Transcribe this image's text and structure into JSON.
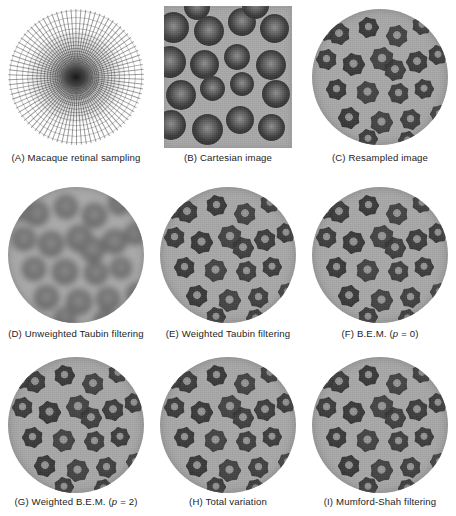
{
  "figure": {
    "panels": [
      {
        "id": "A",
        "letter": "(A)",
        "caption": "Macaque retinal sampling",
        "kind": "mesh",
        "shape": "disc"
      },
      {
        "id": "B",
        "letter": "(B)",
        "caption": "Cartesian image",
        "kind": "smooth",
        "shape": "square"
      },
      {
        "id": "C",
        "letter": "(C)",
        "caption": "Resampled image",
        "kind": "blocky",
        "shape": "disc"
      },
      {
        "id": "D",
        "letter": "(D)",
        "caption": "Unweighted Taubin filtering",
        "kind": "blur",
        "shape": "disc"
      },
      {
        "id": "E",
        "letter": "(E)",
        "caption": "Weighted Taubin filtering",
        "kind": "blocky",
        "shape": "disc"
      },
      {
        "id": "F",
        "letter": "(F)",
        "caption": "B.E.M. (",
        "caption_italic": "p",
        "caption_tail": " = 0)",
        "kind": "blocky",
        "shape": "disc"
      },
      {
        "id": "G",
        "letter": "(G)",
        "caption": "Weighted B.E.M. (",
        "caption_italic": "p",
        "caption_tail": " = 2)",
        "kind": "blocky",
        "shape": "disc"
      },
      {
        "id": "H",
        "letter": "(H)",
        "caption": "Total variation",
        "kind": "blocky",
        "shape": "disc"
      },
      {
        "id": "I",
        "letter": "(I)",
        "caption": "Mumford-Shah filtering",
        "kind": "blocky",
        "shape": "disc"
      }
    ],
    "colors": {
      "background": "#ffffff",
      "plasma_gray": "#a9a9a9",
      "cell_dark": "#343434",
      "caption_text": "#1d1d1d"
    },
    "cells": {
      "cartesian": [
        {
          "x": -6,
          "y": 6,
          "d": 31
        },
        {
          "x": 30,
          "y": 10,
          "d": 30
        },
        {
          "x": 64,
          "y": 2,
          "d": 28
        },
        {
          "x": 96,
          "y": 8,
          "d": 29
        },
        {
          "x": -10,
          "y": 40,
          "d": 32
        },
        {
          "x": 26,
          "y": 44,
          "d": 29
        },
        {
          "x": 60,
          "y": 38,
          "d": 26
        },
        {
          "x": 92,
          "y": 44,
          "d": 30
        },
        {
          "x": 2,
          "y": 74,
          "d": 30
        },
        {
          "x": 36,
          "y": 70,
          "d": 25
        },
        {
          "x": 66,
          "y": 66,
          "d": 24
        },
        {
          "x": 98,
          "y": 74,
          "d": 28
        },
        {
          "x": -8,
          "y": 104,
          "d": 30
        },
        {
          "x": 28,
          "y": 108,
          "d": 31
        },
        {
          "x": 62,
          "y": 100,
          "d": 28
        },
        {
          "x": 94,
          "y": 108,
          "d": 27
        },
        {
          "x": 20,
          "y": -12,
          "d": 26
        },
        {
          "x": 78,
          "y": -14,
          "d": 27
        }
      ],
      "resampled": [
        {
          "x": 16,
          "y": 14,
          "d": 22
        },
        {
          "x": 46,
          "y": 8,
          "d": 21
        },
        {
          "x": 74,
          "y": 16,
          "d": 22
        },
        {
          "x": 100,
          "y": 6,
          "d": 20
        },
        {
          "x": 4,
          "y": 40,
          "d": 21
        },
        {
          "x": 30,
          "y": 44,
          "d": 23
        },
        {
          "x": 58,
          "y": 38,
          "d": 24
        },
        {
          "x": 72,
          "y": 50,
          "d": 22
        },
        {
          "x": 94,
          "y": 42,
          "d": 22
        },
        {
          "x": 116,
          "y": 36,
          "d": 20
        },
        {
          "x": 14,
          "y": 70,
          "d": 21
        },
        {
          "x": 44,
          "y": 72,
          "d": 23
        },
        {
          "x": 76,
          "y": 74,
          "d": 21
        },
        {
          "x": 102,
          "y": 70,
          "d": 20
        },
        {
          "x": 26,
          "y": 98,
          "d": 22
        },
        {
          "x": 58,
          "y": 102,
          "d": 23
        },
        {
          "x": 88,
          "y": 100,
          "d": 21
        },
        {
          "x": 46,
          "y": 120,
          "d": 20
        },
        {
          "x": 86,
          "y": 122,
          "d": 19
        },
        {
          "x": 6,
          "y": 16,
          "d": 16
        },
        {
          "x": 118,
          "y": 96,
          "d": 18
        }
      ]
    }
  }
}
